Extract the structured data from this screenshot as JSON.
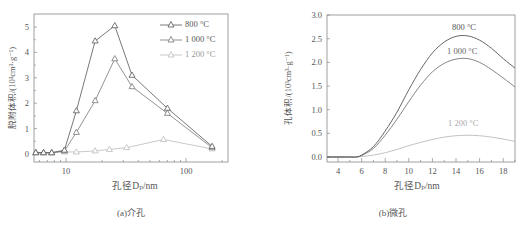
{
  "figure": {
    "panel_a": {
      "caption": "(a)介孔",
      "xlabel": "孔径Dₚ/nm",
      "ylabel": "脱附体积/(10³cm³·g⁻¹)",
      "legend": [
        "800 °C",
        "1 000 °C",
        "1 200 °C"
      ]
    },
    "panel_b": {
      "caption": "(b)微孔",
      "xlabel": "孔径Dₚ/nm",
      "ylabel": "孔体积/(10³cm³·g⁻¹)",
      "curve_labels": [
        "800 °C",
        "1 000 °C",
        "1 200 °C"
      ]
    }
  },
  "chart_data": [
    {
      "type": "line",
      "title": "(a)介孔",
      "xlabel": "孔径Dp/nm",
      "ylabel": "脱附体积/(10³cm³·g⁻¹)",
      "xscale": "log",
      "xlim": [
        5.3,
        190
      ],
      "ylim": [
        -0.3,
        5.5
      ],
      "xticks": [
        10,
        100
      ],
      "yticks": [
        0,
        1,
        2,
        3,
        4,
        5
      ],
      "grid": false,
      "legend_position": "upper right",
      "marker": "triangle-open",
      "x": [
        5.6,
        6.5,
        7.6,
        9.7,
        12.2,
        17.5,
        25.5,
        35.5,
        70,
        165
      ],
      "series": [
        {
          "name": "800 °C",
          "color": "#555555",
          "values": [
            0.05,
            0.05,
            0.05,
            0.15,
            1.7,
            4.45,
            5.05,
            3.1,
            1.8,
            0.3
          ]
        },
        {
          "name": "1 000 °C",
          "color": "#777777",
          "values": [
            0.05,
            0.05,
            0.05,
            0.12,
            0.85,
            2.1,
            3.75,
            2.65,
            1.6,
            0.25
          ]
        },
        {
          "name": "1 200 °C",
          "color": "#bbbbbb",
          "x": [
            5.6,
            6.5,
            7.6,
            9.7,
            12.2,
            17.5,
            23,
            32,
            65,
            165
          ],
          "values": [
            0.05,
            0.05,
            0.05,
            0.08,
            0.08,
            0.12,
            0.18,
            0.25,
            0.57,
            0.2
          ]
        }
      ]
    },
    {
      "type": "line",
      "title": "(b)微孔",
      "xlabel": "孔径Dp/nm",
      "ylabel": "孔体积/(10³cm³·g⁻¹)",
      "xlim": [
        3,
        19
      ],
      "ylim": [
        -0.1,
        3.0
      ],
      "xticks": [
        4,
        6,
        8,
        10,
        12,
        14,
        16,
        18
      ],
      "yticks": [
        0.0,
        0.5,
        1.0,
        1.5,
        2.0,
        2.5,
        3.0
      ],
      "grid": false,
      "legend_position": "inline labels",
      "x": [
        3,
        4,
        5,
        5.5,
        6,
        7,
        8,
        9,
        10,
        11,
        12,
        13,
        14,
        15,
        16,
        17,
        18,
        19
      ],
      "series": [
        {
          "name": "800 °C",
          "color": "#555555",
          "values": [
            0,
            0,
            0,
            0,
            0.04,
            0.22,
            0.55,
            0.95,
            1.42,
            1.85,
            2.2,
            2.43,
            2.55,
            2.56,
            2.47,
            2.3,
            2.08,
            1.88
          ]
        },
        {
          "name": "1 000 °C",
          "color": "#777777",
          "values": [
            0,
            0,
            0,
            0,
            0.03,
            0.18,
            0.46,
            0.8,
            1.17,
            1.52,
            1.8,
            1.98,
            2.07,
            2.08,
            2.0,
            1.85,
            1.67,
            1.48
          ]
        },
        {
          "name": "1 200 °C",
          "color": "#bbbbbb",
          "values": [
            0,
            0,
            0,
            0,
            0.01,
            0.04,
            0.09,
            0.16,
            0.24,
            0.31,
            0.37,
            0.42,
            0.45,
            0.46,
            0.45,
            0.42,
            0.38,
            0.33
          ]
        }
      ]
    }
  ]
}
